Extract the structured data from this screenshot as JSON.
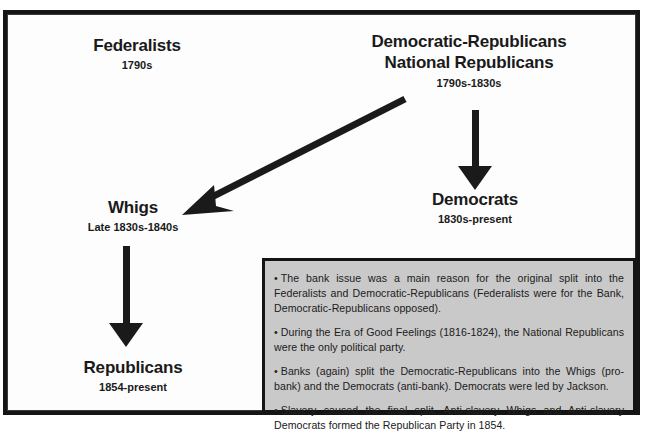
{
  "diagram": {
    "nodes": [
      {
        "id": "federalists",
        "title": "Federalists",
        "dates": "1790s"
      },
      {
        "id": "democratic-republicans",
        "title_line1": "Democratic-Republicans",
        "title_line2": "National Republicans",
        "dates": "1790s-1830s"
      },
      {
        "id": "whigs",
        "title": "Whigs",
        "dates": "Late 1830s-1840s"
      },
      {
        "id": "democrats",
        "title": "Democrats",
        "dates": "1830s-present"
      },
      {
        "id": "republicans",
        "title": "Republicans",
        "dates": "1854-present"
      }
    ],
    "arrows": [
      {
        "id": "demrep-to-democrats",
        "from": "democratic-republicans",
        "to": "democrats",
        "direction": "down"
      },
      {
        "id": "demrep-to-whigs",
        "from": "democratic-republicans",
        "to": "whigs",
        "direction": "diagonal-down-left"
      },
      {
        "id": "whigs-to-republicans",
        "from": "whigs",
        "to": "republicans",
        "direction": "down"
      }
    ]
  },
  "notes": {
    "bullet_glyph": "•",
    "items": [
      "The bank issue was a main reason for the original split into the Federalists and Democratic-Republicans (Federalists were for the Bank, Democratic-Republicans opposed).",
      "During the Era of Good Feelings (1816-1824), the National Republicans were the only political party.",
      "Banks (again) split the Democratic-Republicans into the Whigs (pro-bank) and the Democrats (anti-bank). Democrats were led by Jackson.",
      "Slavery caused the final split. Anti-slavery Whigs and Anti-slavery Democrats formed the Republican Party in 1854."
    ]
  },
  "colors": {
    "ink": "#1a1a1a",
    "frame": "#151515",
    "notes_background": "#c9c9c9",
    "page_background": "#ffffff"
  }
}
